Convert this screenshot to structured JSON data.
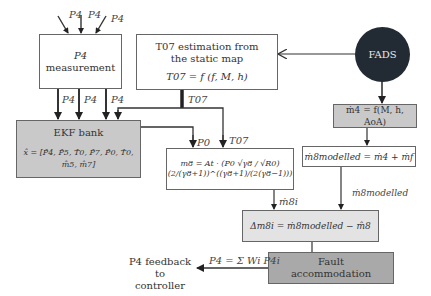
{
  "inputs": {
    "p4_in_1": "P4",
    "p4_in_2": "P4",
    "p4_in_3": "P4"
  },
  "measurement_box": {
    "line1": "P4",
    "line2": "measurement"
  },
  "measurement_outputs": {
    "out1": "P4",
    "out2": "P4",
    "out3": "P4"
  },
  "t07_box": {
    "line1": "T07 estimation from",
    "line2": "the static map",
    "formula": "T07 = f (f, M, h)"
  },
  "t07_label_1": "T07",
  "t07_label_2": "T07",
  "p0_label": "P0",
  "fads": {
    "label": "FADS"
  },
  "ekf_box": {
    "title": "EKF bank",
    "state": "x̂ = [P̂4, P̂5, T̂0, P̂7, P̂0, T̂0, m̂5, m̂7]"
  },
  "m4_box": {
    "formula": "ṁ4 = f(M, h, AoA)"
  },
  "m8_box": {
    "formula": "m8 = At · (P0 √γ8 / √R0) (2/(γ8+1))^((γ8+1)/(2(γ8−1)))"
  },
  "m8mod_box": {
    "formula": "ṁ8modelled = ṁ4 + ṁf"
  },
  "m8i_label": "ṁ8i",
  "m8mod_label": "ṁ8modelled",
  "delta_box": {
    "formula": "Δm8i = ṁ8modelled − m̂8"
  },
  "fault_box": {
    "line1": "Fault",
    "line2": "accommodation"
  },
  "p4_sum_label": "P4 = Σ Wi P4i",
  "feedback": {
    "line1": "P4 feedback to",
    "line2": "controller"
  },
  "colors": {
    "gray_box": "#c9c9c9",
    "light_box": "#e3e3e3",
    "dark_box": "#a9a9a9",
    "fads": "#222a33",
    "line": "#333333"
  }
}
